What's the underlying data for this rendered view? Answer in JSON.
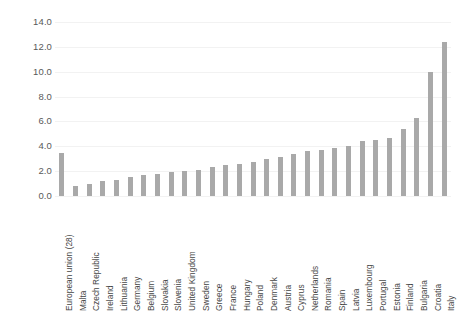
{
  "chart_data": {
    "type": "bar",
    "title": "",
    "subtitle": "",
    "xlabel": "",
    "ylabel": "",
    "ylim": [
      0.0,
      14.0
    ],
    "ytick_step": 2.0,
    "ytick_labels": [
      "0.0",
      "2.0",
      "4.0",
      "6.0",
      "8.0",
      "10.0",
      "12.0",
      "14.0"
    ],
    "ytick_values": [
      0.0,
      2.0,
      4.0,
      6.0,
      8.0,
      10.0,
      12.0,
      14.0
    ],
    "grid": true,
    "legend": false,
    "legend_position": "none",
    "bar_color": "#a9a9a9",
    "gridline_color": "#f2f2f2",
    "categories": [
      "European union (28)",
      "Malta",
      "Czech Republic",
      "Ireland",
      "Lithuania",
      "Germany",
      "Belgium",
      "Slovakia",
      "Slovenia",
      "United Kingdom",
      "Sweden",
      "Greece",
      "France",
      "Hungary",
      "Poland",
      "Denmark",
      "Austria",
      "Cyprus",
      "Netherlands",
      "Romania",
      "Spain",
      "Latvia",
      "Luxembourg",
      "Portugal",
      "Estonia",
      "Finland",
      "Bulgaria",
      "Croatia",
      "Italy"
    ],
    "values": [
      3.5,
      0.8,
      1.0,
      1.2,
      1.3,
      1.5,
      1.7,
      1.8,
      1.9,
      2.0,
      2.1,
      2.3,
      2.5,
      2.6,
      2.7,
      3.0,
      3.1,
      3.4,
      3.6,
      3.7,
      3.9,
      4.0,
      4.4,
      4.5,
      4.7,
      5.4,
      6.3,
      10.0,
      12.4
    ]
  }
}
